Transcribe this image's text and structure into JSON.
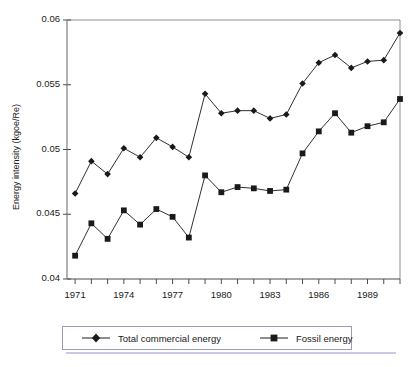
{
  "figure": {
    "bottom_caption": "",
    "legend": {
      "entries": [
        {
          "label": "Total commercial energy",
          "marker": "diamond-marker",
          "color": "#1a1a1a"
        },
        {
          "label": "Fossil energy",
          "marker": "square-marker",
          "color": "#1a1a1a"
        }
      ]
    }
  },
  "chart_data": {
    "type": "line",
    "title": "",
    "xlabel": "",
    "ylabel": "Energy intensity (kgoe/Re)",
    "xlim": [
      1970.5,
      1991
    ],
    "ylim": [
      0.04,
      0.06
    ],
    "grid": false,
    "legend_position": "bottom",
    "y_ticks": [
      0.04,
      0.045,
      0.05,
      0.055,
      0.06
    ],
    "y_tick_labels": [
      "0.04",
      "0.045",
      "0.05",
      "0.055",
      "0.06"
    ],
    "x_ticks": [
      1971,
      1972,
      1973,
      1974,
      1975,
      1976,
      1977,
      1978,
      1979,
      1980,
      1981,
      1982,
      1983,
      1984,
      1985,
      1986,
      1987,
      1988,
      1989,
      1990,
      1991
    ],
    "x_tick_labels": [
      "1971",
      "",
      "",
      "1974",
      "",
      "",
      "1977",
      "",
      "",
      "1980",
      "",
      "",
      "1983",
      "",
      "",
      "1986",
      "",
      "",
      "1989",
      "",
      ""
    ],
    "x": [
      1971,
      1972,
      1973,
      1974,
      1975,
      1976,
      1977,
      1978,
      1979,
      1980,
      1981,
      1982,
      1983,
      1984,
      1985,
      1986,
      1987,
      1988,
      1989,
      1990,
      1991
    ],
    "series": [
      {
        "name": "Total commercial energy",
        "marker": "diamond",
        "color": "#1a1a1a",
        "values": [
          0.0466,
          0.0491,
          0.0481,
          0.0501,
          0.0494,
          0.0509,
          0.0502,
          0.0494,
          0.0543,
          0.0528,
          0.053,
          0.053,
          0.0524,
          0.0527,
          0.0551,
          0.0567,
          0.0573,
          0.0563,
          0.0568,
          0.0569,
          0.059
        ]
      },
      {
        "name": "Fossil energy",
        "marker": "square",
        "color": "#1a1a1a",
        "values": [
          0.0418,
          0.0443,
          0.0431,
          0.0453,
          0.0442,
          0.0454,
          0.0448,
          0.0432,
          0.048,
          0.0467,
          0.0471,
          0.047,
          0.0468,
          0.0469,
          0.0497,
          0.0514,
          0.0528,
          0.0513,
          0.0518,
          0.0521,
          0.0539
        ]
      }
    ]
  }
}
